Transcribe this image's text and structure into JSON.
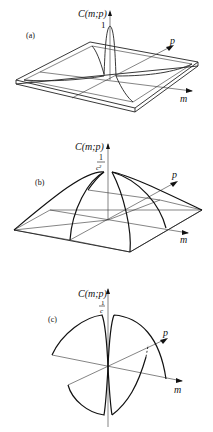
{
  "figure": {
    "panels": [
      {
        "id": "a",
        "label": "(a)",
        "ylabel": "C(m;p)",
        "peak_label": "1",
        "x_axis": "m",
        "y_axis": "p",
        "description": "Sharp spike at origin on a nearly flat square plateau with raised rim"
      },
      {
        "id": "b",
        "label": "(b)",
        "ylabel": "C(m;p)",
        "peak_label_num": "1",
        "peak_label_den": "c²",
        "x_axis": "m",
        "y_axis": "p",
        "description": "Pyramid-like dome surface peaking at origin"
      },
      {
        "id": "c",
        "label": "(c)",
        "ylabel": "C(m;p)",
        "peak_label_num": "1",
        "peak_label_den": "c",
        "x_axis": "m",
        "y_axis": "p",
        "description": "Surface with two lobes, pinched at m=0 axis"
      }
    ]
  }
}
